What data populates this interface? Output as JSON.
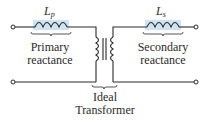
{
  "diagram": {
    "colors": {
      "wire": "#2a2a2a",
      "inductor_highlight": "#cfe3f2",
      "text": "#2a2a2a",
      "terminal_fill": "#ffffff"
    },
    "components": {
      "primary_inductor": {
        "symbol": "L",
        "subscript": "p",
        "label_line1": "Primary",
        "label_line2": "reactance"
      },
      "secondary_inductor": {
        "symbol": "L",
        "subscript": "s",
        "label_line1": "Secondary",
        "label_line2": "reactance"
      },
      "transformer": {
        "label_line1": "Ideal",
        "label_line2": "Transformer"
      }
    },
    "terminals": [
      "top-left",
      "bottom-left",
      "top-right",
      "bottom-right"
    ]
  }
}
